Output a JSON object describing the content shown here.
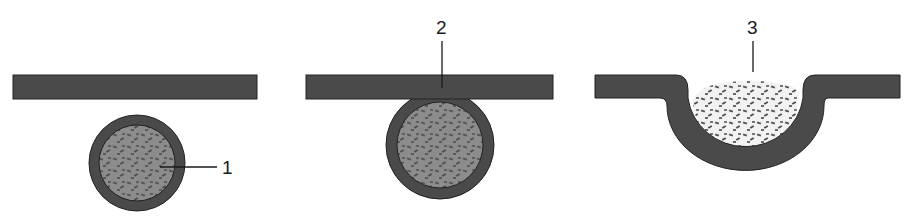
{
  "diagram": {
    "type": "process-stages",
    "colors": {
      "membrane": "#4a4a4a",
      "membrane_edge": "#222222",
      "vesicle_content": "#8a8a8a",
      "particles": "#4f4f4f",
      "background": "#ffffff",
      "label": "#1a1a1a"
    },
    "stages": [
      {
        "id": 1,
        "label": "1",
        "description": "vesicle separate from membrane"
      },
      {
        "id": 2,
        "label": "2",
        "description": "vesicle docking/fusing with membrane"
      },
      {
        "id": 3,
        "label": "3",
        "description": "contents released through opened membrane pit"
      }
    ]
  }
}
